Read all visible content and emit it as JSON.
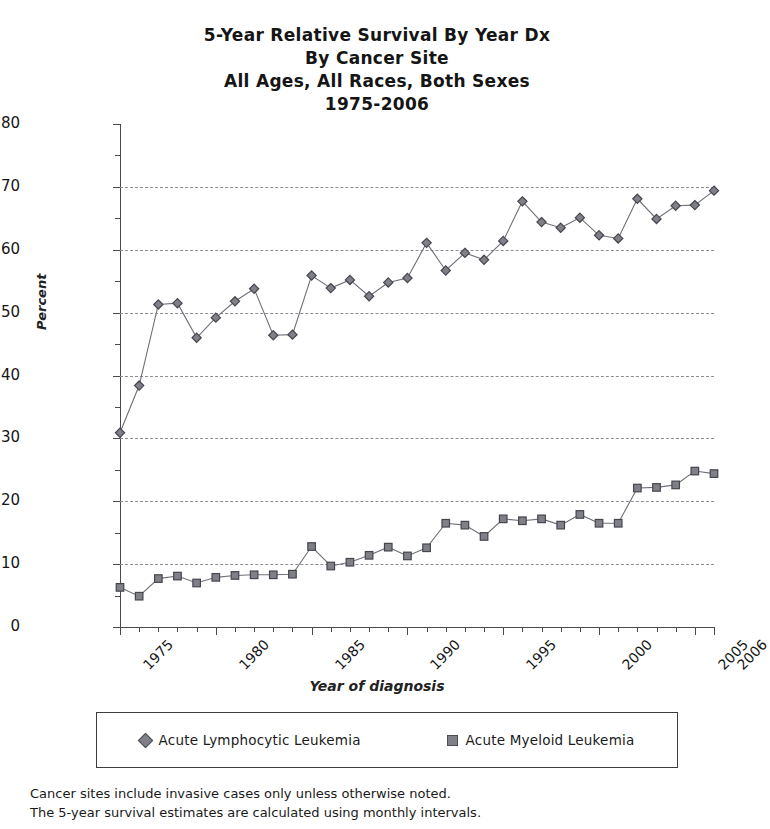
{
  "title": {
    "line1": "5-Year Relative Survival By Year Dx",
    "line2": "By Cancer Site",
    "line3": "All Ages, All Races, Both Sexes",
    "line4": "1975-2006"
  },
  "footnotes": [
    "Cancer sites include invasive cases only unless otherwise noted.",
    "The 5-year survival estimates are calculated using monthly intervals."
  ],
  "legend": {
    "entries": [
      {
        "label": "Acute Lymphocytic Leukemia",
        "marker": "diamond",
        "color": "#808088"
      },
      {
        "label": "Acute Myeloid Leukemia",
        "marker": "square",
        "color": "#808088"
      }
    ]
  },
  "chart_data": {
    "type": "line",
    "xlabel": "Year of diagnosis",
    "ylabel": "Percent",
    "xlim": [
      1975,
      2006
    ],
    "ylim": [
      0,
      80
    ],
    "ytick_major": [
      0,
      10,
      20,
      30,
      40,
      50,
      60,
      70,
      80
    ],
    "ytick_minor": [
      5,
      15,
      25,
      35,
      45,
      55,
      65,
      75
    ],
    "ytick_labels": [
      "0",
      "10",
      "20",
      "30",
      "40",
      "50",
      "60",
      "70",
      "80"
    ],
    "xtick_labels": [
      "1975",
      "1980",
      "1985",
      "1990",
      "1995",
      "2000",
      "2005",
      "2006"
    ],
    "xtick_label_values": [
      1975,
      1980,
      1985,
      1990,
      1995,
      2000,
      2005,
      2006
    ],
    "grid": "horizontal-dashed",
    "legend_position": "bottom",
    "x": [
      1975,
      1976,
      1977,
      1978,
      1979,
      1980,
      1981,
      1982,
      1983,
      1984,
      1985,
      1986,
      1987,
      1988,
      1989,
      1990,
      1991,
      1992,
      1993,
      1994,
      1995,
      1996,
      1997,
      1998,
      1999,
      2000,
      2001,
      2002,
      2003,
      2004,
      2005,
      2006
    ],
    "series": [
      {
        "name": "Acute Lymphocytic Leukemia",
        "marker": "diamond",
        "color": "#808088",
        "values": [
          30.9,
          38.4,
          51.3,
          51.5,
          46.0,
          49.2,
          51.8,
          53.8,
          46.4,
          46.5,
          55.9,
          53.9,
          55.2,
          52.6,
          54.8,
          55.5,
          61.1,
          56.7,
          59.5,
          58.4,
          61.4,
          67.7,
          64.4,
          63.5,
          65.1,
          62.3,
          61.8,
          68.1,
          64.9,
          67.0,
          67.1,
          69.4
        ]
      },
      {
        "name": "Acute Myeloid Leukemia",
        "marker": "square",
        "color": "#808088",
        "values": [
          6.3,
          4.9,
          7.7,
          8.1,
          7.0,
          7.9,
          8.2,
          8.3,
          8.3,
          8.4,
          12.8,
          9.7,
          10.3,
          11.4,
          12.7,
          11.3,
          12.6,
          16.5,
          16.2,
          14.4,
          17.2,
          16.9,
          17.2,
          16.2,
          17.9,
          16.5,
          16.5,
          22.1,
          22.2,
          22.6,
          24.8,
          24.4
        ]
      }
    ]
  }
}
